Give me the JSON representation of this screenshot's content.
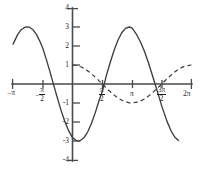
{
  "chart_data": {
    "type": "line",
    "title": "",
    "subtitle": "",
    "xlabel": "",
    "ylabel": "",
    "xlim": [
      -3.141592653589793,
      6.283185307179586
    ],
    "ylim": [
      -4,
      4
    ],
    "grid": false,
    "legend_position": "none",
    "x_tick_labels": [
      "-π",
      "-π/2",
      "π/2",
      "π",
      "3π/2",
      "2π"
    ],
    "x_tick_values": [
      -3.141592653589793,
      -1.5707963267948966,
      1.5707963267948966,
      3.141592653589793,
      4.71238898038469,
      6.283185307179586
    ],
    "y_tick_labels": [
      "4",
      "3",
      "2",
      "1",
      "-1",
      "-2",
      "-3",
      "-4"
    ],
    "y_tick_values": [
      4,
      3,
      2,
      1,
      -1,
      -2,
      -3,
      -4
    ],
    "series": [
      {
        "name": "solid-curve",
        "style": "solid",
        "color": "#3d3d3d",
        "amplitude": 3,
        "x": [
          -3.14159,
          -2.9,
          -2.7,
          -2.5,
          -2.3,
          -2.1,
          -1.9,
          -1.7,
          -1.5708,
          -1.4,
          -1.2,
          -1.0,
          -0.8,
          -0.6,
          -0.4,
          -0.2,
          0.0,
          0.2,
          0.4,
          0.6,
          0.8,
          1.0,
          1.2,
          1.4,
          1.5708,
          1.8,
          2.0,
          2.2,
          2.4,
          2.6,
          2.8,
          3.0,
          3.14159,
          3.4,
          3.6,
          3.8,
          4.0,
          4.2,
          4.4,
          4.6,
          4.71239,
          5.0,
          5.2,
          5.4,
          5.6
        ],
        "y": [
          2.1,
          2.6,
          2.87,
          2.99,
          3.0,
          2.87,
          2.6,
          2.2,
          1.88,
          1.35,
          0.68,
          -0.03,
          -0.73,
          -1.4,
          -1.99,
          -2.47,
          -2.82,
          -2.98,
          -2.99,
          -2.83,
          -2.53,
          -2.08,
          -1.52,
          -0.88,
          -0.4,
          0.48,
          1.16,
          1.78,
          2.3,
          2.7,
          2.93,
          3.0,
          2.95,
          2.58,
          2.2,
          1.72,
          1.16,
          0.53,
          -0.12,
          -0.77,
          -1.15,
          -1.98,
          -2.45,
          -2.79,
          -2.97
        ]
      },
      {
        "name": "dashed-curve",
        "style": "dashed",
        "color": "#3d3d3d",
        "amplitude": 1,
        "x": [
          0.0,
          0.25,
          0.5,
          0.75,
          1.0,
          1.25,
          1.5708,
          1.85,
          2.1,
          2.4,
          2.7,
          3.0,
          3.14159,
          3.5,
          3.8,
          4.0,
          4.3,
          4.6,
          4.71239,
          5.0,
          5.3,
          5.6,
          5.9,
          6.28319
        ],
        "y": [
          1.0,
          0.97,
          0.88,
          0.73,
          0.54,
          0.32,
          0.0,
          -0.28,
          -0.5,
          -0.74,
          -0.9,
          -0.99,
          -1.0,
          -0.94,
          -0.79,
          -0.65,
          -0.39,
          -0.11,
          0.0,
          0.28,
          0.55,
          0.78,
          0.93,
          1.0
        ]
      }
    ]
  },
  "axes": {
    "x_ticks": [
      {
        "id": "neg-pi",
        "label_num": "π",
        "label_den": "",
        "negative": true
      },
      {
        "id": "neg-pi-over-2",
        "label_num": "π",
        "label_den": "2",
        "negative": true
      },
      {
        "id": "pi-over-2",
        "label_num": "π",
        "label_den": "2",
        "negative": false
      },
      {
        "id": "pi",
        "label_num": "π",
        "label_den": "",
        "negative": false
      },
      {
        "id": "three-pi-over-2",
        "label_num": "3π",
        "label_den": "2",
        "negative": false
      },
      {
        "id": "two-pi",
        "label_num": "2π",
        "label_den": "",
        "negative": false
      }
    ],
    "y_ticks": [
      {
        "id": "y-4",
        "label": "4"
      },
      {
        "id": "y-3",
        "label": "3"
      },
      {
        "id": "y-2",
        "label": "2"
      },
      {
        "id": "y-1",
        "label": "1"
      },
      {
        "id": "y-neg-1",
        "label": "-1"
      },
      {
        "id": "y-neg-2",
        "label": "-2"
      },
      {
        "id": "y-neg-3",
        "label": "-3"
      },
      {
        "id": "y-neg-4",
        "label": "-4"
      }
    ]
  },
  "labels": {
    "x_neg_pi": "π",
    "x_two_pi": "2π",
    "x_pi": "π",
    "num_pi": "π",
    "num_three_pi": "3π",
    "den_two": "2",
    "minus": "−",
    "y4": "4",
    "y3": "3",
    "y2": "2",
    "y1": "1",
    "ym1": "-1",
    "ym2": "-2",
    "ym3": "-3",
    "ym4": "-4"
  }
}
